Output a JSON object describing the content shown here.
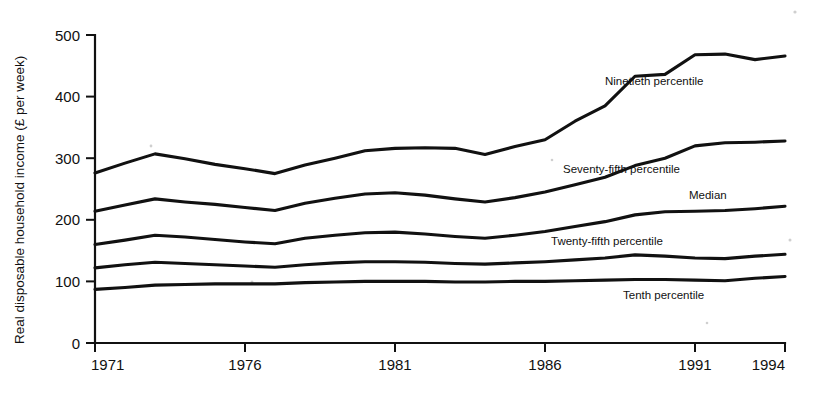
{
  "chart_data": {
    "type": "line",
    "title": "",
    "subtitle": "",
    "xlabel": "",
    "ylabel": "Real disposable household income (£ per week)",
    "grid": false,
    "legend_position": "inline-right",
    "xlim": [
      1971,
      1994
    ],
    "ylim": [
      0,
      500
    ],
    "x_ticks": [
      1971,
      1976,
      1981,
      1986,
      1991,
      1994
    ],
    "x_tick_labels": [
      "1971",
      "1976",
      "1981",
      "1986",
      "1991",
      "1994"
    ],
    "y_ticks": [
      0,
      100,
      200,
      300,
      400,
      500
    ],
    "y_tick_labels": [
      "0",
      "100",
      "200",
      "300",
      "400",
      "500"
    ],
    "x": [
      1971,
      1972,
      1973,
      1974,
      1975,
      1976,
      1977,
      1978,
      1979,
      1980,
      1981,
      1982,
      1983,
      1984,
      1985,
      1986,
      1987,
      1988,
      1989,
      1990,
      1991,
      1992,
      1993,
      1994
    ],
    "series": [
      {
        "name": "Ninetieth percentile",
        "label": "Ninetieth percentile",
        "color": "#111111",
        "values": [
          276,
          292,
          307,
          299,
          290,
          283,
          275,
          289,
          300,
          312,
          316,
          317,
          316,
          306,
          319,
          330,
          360,
          385,
          433,
          436,
          468,
          469,
          460,
          466
        ]
      },
      {
        "name": "Seventy-fifth percentile",
        "label": "Seventy-fifth percentile",
        "color": "#111111",
        "values": [
          214,
          224,
          234,
          229,
          225,
          220,
          215,
          227,
          235,
          242,
          244,
          240,
          234,
          229,
          236,
          245,
          257,
          269,
          288,
          300,
          320,
          325,
          326,
          328
        ]
      },
      {
        "name": "Median",
        "label": "Median",
        "color": "#111111",
        "values": [
          160,
          167,
          175,
          172,
          168,
          164,
          161,
          170,
          175,
          179,
          180,
          177,
          173,
          170,
          175,
          181,
          189,
          197,
          208,
          213,
          214,
          215,
          218,
          222
        ]
      },
      {
        "name": "Twenty-fifth percentile",
        "label": "Twenty-fifth percentile",
        "color": "#111111",
        "values": [
          122,
          127,
          131,
          129,
          127,
          125,
          123,
          127,
          130,
          132,
          132,
          131,
          129,
          128,
          130,
          132,
          135,
          138,
          143,
          141,
          138,
          137,
          141,
          144
        ]
      },
      {
        "name": "Tenth percentile",
        "label": "Tenth percentile",
        "color": "#111111",
        "values": [
          87,
          90,
          94,
          95,
          96,
          96,
          96,
          98,
          99,
          100,
          100,
          100,
          99,
          99,
          100,
          100,
          101,
          102,
          103,
          103,
          102,
          101,
          105,
          108
        ]
      }
    ],
    "annotations": [
      {
        "text": "Ninetieth percentile",
        "x": 1988.0,
        "y": 425
      },
      {
        "text": "Seventy-fifth percentile",
        "x": 1986.6,
        "y": 282
      },
      {
        "text": "Median",
        "x": 1990.8,
        "y": 240
      },
      {
        "text": "Twenty-fifth percentile",
        "x": 1986.2,
        "y": 165
      },
      {
        "text": "Tenth percentile",
        "x": 1988.6,
        "y": 78
      }
    ]
  }
}
